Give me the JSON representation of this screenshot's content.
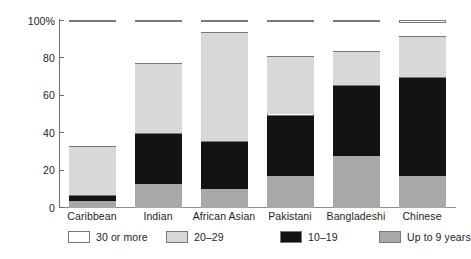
{
  "chart_data": {
    "type": "bar",
    "title": "",
    "subtitle": "",
    "xlabel": "",
    "ylabel": "",
    "stacked": true,
    "stack_mode": "percent",
    "grid": false,
    "legend_position": "bottom",
    "ylim": [
      0,
      100
    ],
    "yticks": [
      0,
      20,
      40,
      60,
      80,
      100
    ],
    "ytick_labels": [
      "0",
      "20",
      "40",
      "60",
      "80",
      "100%"
    ],
    "categories": [
      "Caribbean",
      "Indian",
      "African Asian",
      "Pakistani",
      "Bangladeshi",
      "Chinese"
    ],
    "series": [
      {
        "name": "Up to 9 years",
        "color": "#a8a8a8",
        "values": [
          4,
          13,
          10,
          17,
          28,
          17
        ]
      },
      {
        "name": "10–19",
        "color": "#131313",
        "values": [
          3,
          27,
          26,
          33,
          38,
          53
        ]
      },
      {
        "name": "20–29",
        "color": "#d8d8d8",
        "values": [
          26,
          37.5,
          58,
          31.5,
          18,
          22
        ]
      },
      {
        "name": "30 or more",
        "color": "#ffffff",
        "values": [
          67,
          22.5,
          6,
          18.5,
          16,
          7.5
        ]
      }
    ],
    "cumulative_tops": {
      "Caribbean": [
        4,
        7,
        33,
        100
      ],
      "Indian": [
        13,
        40,
        77.5,
        100
      ],
      "African Asian": [
        10,
        36,
        94,
        100
      ],
      "Pakistani": [
        17,
        50,
        81.5,
        100
      ],
      "Bangladeshi": [
        28,
        66,
        84,
        100
      ],
      "Chinese": [
        17,
        70.5,
        92.5,
        100
      ]
    },
    "legend": [
      {
        "label": "30 or more",
        "swatch": "#ffffff"
      },
      {
        "label": "20–29",
        "swatch": "#d8d8d8"
      },
      {
        "label": "10–19",
        "swatch": "#131313"
      },
      {
        "label": "Up to 9 years",
        "swatch": "#a8a8a8"
      }
    ]
  }
}
